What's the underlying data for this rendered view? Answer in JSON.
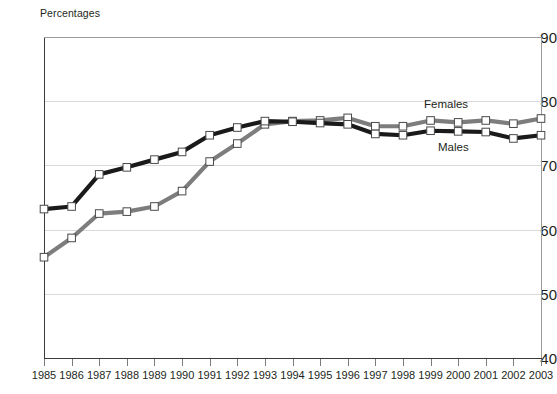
{
  "chart_data": {
    "type": "line",
    "title": "",
    "ylabel": "Percentages",
    "xlabel": "",
    "ylim": [
      40,
      90
    ],
    "yticks": [
      40,
      50,
      60,
      70,
      80,
      90
    ],
    "grid": true,
    "legend_position": "inline-annotation",
    "categories": [
      "1985",
      "1986",
      "1987",
      "1988",
      "1989",
      "1990",
      "1991",
      "1992",
      "1993",
      "1994",
      "1995",
      "1996",
      "1997",
      "1998",
      "1999",
      "2000",
      "2001",
      "2002",
      "2003"
    ],
    "series": [
      {
        "name": "Males",
        "color": "#1a1a1a",
        "marker": "square-open",
        "values": [
          63.2,
          63.6,
          68.6,
          69.7,
          70.9,
          72.1,
          74.7,
          75.9,
          76.9,
          76.8,
          76.6,
          76.4,
          74.9,
          74.7,
          75.4,
          75.3,
          75.2,
          74.2,
          74.7
        ]
      },
      {
        "name": "Females",
        "color": "#7d7d7d",
        "marker": "square-open",
        "values": [
          55.7,
          58.7,
          62.5,
          62.8,
          63.6,
          66.0,
          70.6,
          73.4,
          76.4,
          76.9,
          77.0,
          77.4,
          76.1,
          76.1,
          77.0,
          76.7,
          77.0,
          76.5,
          77.3
        ]
      }
    ],
    "annotations": [
      {
        "text": "Females",
        "series": "Females"
      },
      {
        "text": "Males",
        "series": "Males"
      }
    ]
  },
  "axis": {
    "title": "Percentages",
    "y_tick_labels": [
      "90",
      "80",
      "70",
      "60",
      "50",
      "40"
    ],
    "x_tick_labels": [
      "1985",
      "1986",
      "1987",
      "1988",
      "1989",
      "1990",
      "1991",
      "1992",
      "1993",
      "1994",
      "1995",
      "1996",
      "1997",
      "1998",
      "1999",
      "2000",
      "2001",
      "2002",
      "2003"
    ]
  },
  "labels": {
    "females": "Females",
    "males": "Males"
  },
  "colors": {
    "males_line": "#1a1a1a",
    "females_line": "#7d7d7d",
    "grid": "#d9d9d9",
    "axis": "#3a3a3a",
    "text": "#231f20",
    "marker_fill": "#ffffff"
  }
}
